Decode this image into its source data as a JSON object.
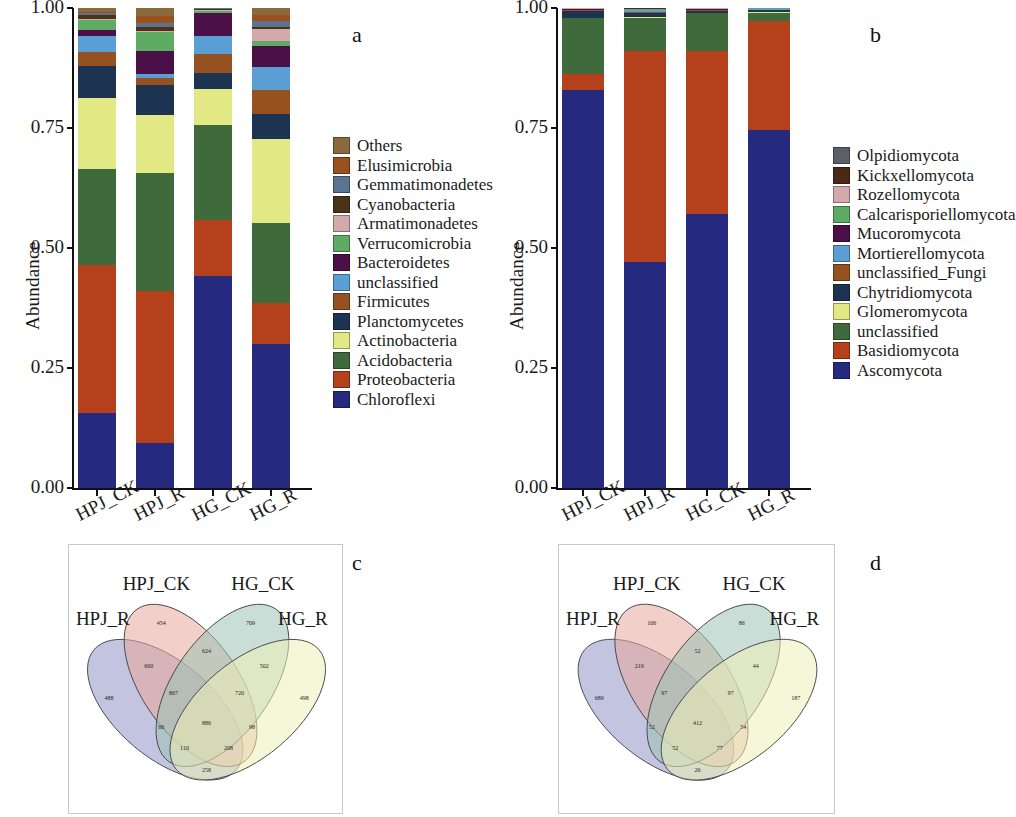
{
  "figure": {
    "background": "#ffffff",
    "panels": [
      {
        "letter": "a"
      },
      {
        "letter": "b"
      },
      {
        "letter": "c"
      },
      {
        "letter": "d"
      }
    ]
  },
  "panel_a": {
    "letter": "a",
    "ylabel": "Abundance",
    "ytick_labels": [
      "1.00",
      "0.75",
      "0.50",
      "0.25",
      "0.00"
    ],
    "xtick_labels": [
      "HPJ_CK",
      "HPJ_R",
      "HG_CK",
      "HG_R"
    ],
    "legend_title": "",
    "legend": [
      {
        "label": "Others",
        "color": "#8a6a3c"
      },
      {
        "label": "Elusimicrobia",
        "color": "#9c4f1f"
      },
      {
        "label": "Gemmatimonadetes",
        "color": "#5a7390"
      },
      {
        "label": "Cyanobacteria",
        "color": "#4a3418"
      },
      {
        "label": "Armatimonadetes",
        "color": "#d4a9ad"
      },
      {
        "label": "Verrucomicrobia",
        "color": "#5eab63"
      },
      {
        "label": "Bacteroidetes",
        "color": "#4c1049"
      },
      {
        "label": "unclassified",
        "color": "#5b9ed4"
      },
      {
        "label": "Firmicutes",
        "color": "#95511f"
      },
      {
        "label": "Planctomycetes",
        "color": "#1d3352"
      },
      {
        "label": "Actinobacteria",
        "color": "#e2e883"
      },
      {
        "label": "Acidobacteria",
        "color": "#3f6b3c"
      },
      {
        "label": "Proteobacteria",
        "color": "#b4401c"
      },
      {
        "label": "Chloroflexi",
        "color": "#252a7e"
      }
    ]
  },
  "panel_b": {
    "letter": "b",
    "ylabel": "Abundance",
    "ytick_labels": [
      "1.00",
      "0.75",
      "0.50",
      "0.25",
      "0.00"
    ],
    "xtick_labels": [
      "HPJ_CK",
      "HPJ_R",
      "HG_CK",
      "HG_R"
    ],
    "legend": [
      {
        "label": "Olpidiomycota",
        "color": "#5b6066"
      },
      {
        "label": "Kickxellomycota",
        "color": "#4a2a16"
      },
      {
        "label": "Rozellomycota",
        "color": "#d4a9ad"
      },
      {
        "label": "Calcarisporiellomycota",
        "color": "#5eab63"
      },
      {
        "label": "Mucoromycota",
        "color": "#4c1049"
      },
      {
        "label": "Mortierellomycota",
        "color": "#5b9ed4"
      },
      {
        "label": "unclassified_Fungi",
        "color": "#95511f"
      },
      {
        "label": "Chytridiomycota",
        "color": "#1d3352"
      },
      {
        "label": "Glomeromycota",
        "color": "#e2e883"
      },
      {
        "label": "unclassified",
        "color": "#3f6b3c"
      },
      {
        "label": "Basidiomycota",
        "color": "#b4401c"
      },
      {
        "label": "Ascomycota",
        "color": "#252a7e"
      }
    ]
  },
  "panel_c": {
    "letter": "c",
    "set_labels": [
      "HPJ_R",
      "HPJ_CK",
      "HG_CK",
      "HG_R"
    ],
    "set_colors": [
      "#8f93c6",
      "#e8a89a",
      "#9dc3b4",
      "#eff0b8"
    ]
  },
  "panel_d": {
    "letter": "d",
    "set_labels": [
      "HPJ_R",
      "HPJ_CK",
      "HG_CK",
      "HG_R"
    ],
    "set_colors": [
      "#8f93c6",
      "#e8a89a",
      "#9dc3b4",
      "#eff0b8"
    ]
  },
  "chart_data": [
    {
      "panel": "a",
      "type": "bar",
      "stacked": true,
      "normalized": true,
      "title": "",
      "xlabel": "",
      "ylabel": "Abundance",
      "ylim": [
        0,
        1
      ],
      "yticks": [
        0,
        0.25,
        0.5,
        0.75,
        1
      ],
      "grid": false,
      "legend_position": "right",
      "categories": [
        "HPJ_CK",
        "HPJ_R",
        "HG_CK",
        "HG_R"
      ],
      "series": [
        {
          "name": "Chloroflexi",
          "color": "#252a7e",
          "values": [
            0.157,
            0.093,
            0.442,
            0.299
          ]
        },
        {
          "name": "Proteobacteria",
          "color": "#b4401c",
          "values": [
            0.308,
            0.318,
            0.117,
            0.086
          ]
        },
        {
          "name": "Acidobacteria",
          "color": "#3f6b3c",
          "values": [
            0.2,
            0.246,
            0.197,
            0.167
          ]
        },
        {
          "name": "Actinobacteria",
          "color": "#e2e883",
          "values": [
            0.148,
            0.12,
            0.075,
            0.175
          ]
        },
        {
          "name": "Planctomycetes",
          "color": "#1d3352",
          "values": [
            0.067,
            0.063,
            0.034,
            0.053
          ]
        },
        {
          "name": "Firmicutes",
          "color": "#95511f",
          "values": [
            0.029,
            0.013,
            0.04,
            0.049
          ]
        },
        {
          "name": "unclassified",
          "color": "#5b9ed4",
          "values": [
            0.032,
            0.01,
            0.037,
            0.049
          ]
        },
        {
          "name": "Bacteroidetes",
          "color": "#4c1049",
          "values": [
            0.014,
            0.048,
            0.047,
            0.043
          ]
        },
        {
          "name": "Verrucomicrobia",
          "color": "#5eab63",
          "values": [
            0.02,
            0.038,
            0.004,
            0.01
          ]
        },
        {
          "name": "Armatimonadetes",
          "color": "#d4a9ad",
          "values": [
            0.003,
            0.004,
            0.003,
            0.025
          ]
        },
        {
          "name": "Cyanobacteria",
          "color": "#4a3418",
          "values": [
            0.008,
            0.008,
            0.002,
            0.005
          ]
        },
        {
          "name": "Gemmatimonadetes",
          "color": "#5a7390",
          "values": [
            0.004,
            0.008,
            0.002,
            0.012
          ]
        },
        {
          "name": "Elusimicrobia",
          "color": "#9c4f1f",
          "values": [
            0.002,
            0.015,
            0.0,
            0.013
          ]
        },
        {
          "name": "Others",
          "color": "#8a6a3c",
          "values": [
            0.008,
            0.016,
            0.0,
            0.014
          ]
        }
      ]
    },
    {
      "panel": "b",
      "type": "bar",
      "stacked": true,
      "normalized": true,
      "title": "",
      "xlabel": "",
      "ylabel": "Abundance",
      "ylim": [
        0,
        1
      ],
      "yticks": [
        0,
        0.25,
        0.5,
        0.75,
        1
      ],
      "grid": false,
      "legend_position": "right",
      "categories": [
        "HPJ_CK",
        "HPJ_R",
        "HG_CK",
        "HG_R"
      ],
      "series": [
        {
          "name": "Ascomycota",
          "color": "#252a7e",
          "values": [
            0.828,
            0.47,
            0.57,
            0.745
          ]
        },
        {
          "name": "Basidiomycota",
          "color": "#b4401c",
          "values": [
            0.035,
            0.44,
            0.34,
            0.228
          ]
        },
        {
          "name": "unclassified",
          "color": "#3f6b3c",
          "values": [
            0.115,
            0.068,
            0.079,
            0.017
          ]
        },
        {
          "name": "Glomeromycota",
          "color": "#e2e883",
          "values": [
            0.002,
            0.003,
            0.001,
            0.001
          ]
        },
        {
          "name": "Chytridiomycota",
          "color": "#1d3352",
          "values": [
            0.014,
            0.008,
            0.004,
            0.004
          ]
        },
        {
          "name": "unclassified_Fungi",
          "color": "#95511f",
          "values": [
            0.001,
            0.003,
            0.001,
            0.001
          ]
        },
        {
          "name": "Mortierellomycota",
          "color": "#5b9ed4",
          "values": [
            0.001,
            0.003,
            0.001,
            0.001
          ]
        },
        {
          "name": "Mucoromycota",
          "color": "#4c1049",
          "values": [
            0.001,
            0.001,
            0.001,
            0.001
          ]
        },
        {
          "name": "Calcarisporiellomycota",
          "color": "#5eab63",
          "values": [
            0.001,
            0.001,
            0.001,
            0.001
          ]
        },
        {
          "name": "Rozellomycota",
          "color": "#d4a9ad",
          "values": [
            0.001,
            0.001,
            0.001,
            0.001
          ]
        },
        {
          "name": "Kickxellomycota",
          "color": "#4a2a16",
          "values": [
            0.0,
            0.001,
            0.0,
            0.0
          ]
        },
        {
          "name": "Olpidiomycota",
          "color": "#5b6066",
          "values": [
            0.001,
            0.001,
            0.001,
            0.0
          ]
        }
      ]
    },
    {
      "panel": "c",
      "type": "venn",
      "sets": [
        "HPJ_R",
        "HPJ_CK",
        "HG_CK",
        "HG_R"
      ],
      "region_labels": [
        "488",
        "454",
        "709",
        "498",
        "600",
        "624",
        "502",
        "867",
        "720",
        "886",
        "66",
        "98",
        "110",
        "208",
        "258"
      ]
    },
    {
      "panel": "d",
      "type": "venn",
      "sets": [
        "HPJ_R",
        "HPJ_CK",
        "HG_CK",
        "HG_R"
      ],
      "region_labels": [
        "689",
        "106",
        "86",
        "187",
        "219",
        "52",
        "44",
        "97",
        "97",
        "412",
        "52",
        "54",
        "52",
        "77",
        "26"
      ]
    }
  ]
}
